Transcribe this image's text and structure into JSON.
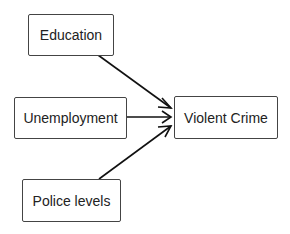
{
  "diagram": {
    "nodes": [
      {
        "id": "education",
        "label": "Education"
      },
      {
        "id": "unemployment",
        "label": "Unemployment"
      },
      {
        "id": "police",
        "label": "Police levels"
      },
      {
        "id": "violent_crime",
        "label": "Violent Crime"
      }
    ],
    "edges": [
      {
        "from": "education",
        "to": "violent_crime"
      },
      {
        "from": "unemployment",
        "to": "violent_crime"
      },
      {
        "from": "police",
        "to": "violent_crime"
      }
    ]
  }
}
